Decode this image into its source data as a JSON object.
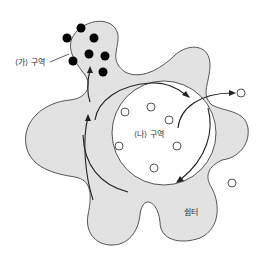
{
  "labels": {
    "region_ga": "⟨가⟩ 구역",
    "region_na": "⟨나⟩ 구역",
    "shelter": "쉼터"
  },
  "colors": {
    "blob_fill": "#e2e2e2",
    "outline": "#555555",
    "dot": "#000000",
    "circle_fill": "#ffffff"
  },
  "elements": {
    "filled_dots": 7,
    "open_circles_inside_na": 6,
    "open_circles_outside": 2,
    "open_circle_in_blob": 1
  }
}
